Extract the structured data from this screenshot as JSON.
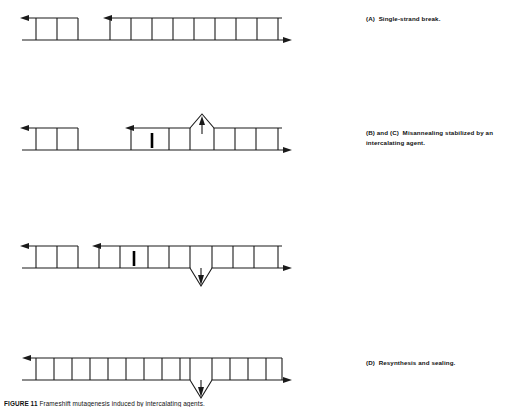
{
  "figure": {
    "title_number": "FIGURE 11",
    "title_text": "Frameshift mutagenesis induced by intercalating agents.",
    "caption_full": "FIGURE 11   Frameshift mutagenesis induced by intercalating agents."
  },
  "colors": {
    "ink": "#1a1a1a",
    "agent": "#000000",
    "background": "#ffffff"
  },
  "panels": [
    {
      "id": "panel-a",
      "label": "(A)",
      "caption": "Single-strand break.",
      "caption_lines": [
        "(A)  Single-strand break."
      ],
      "top": 0,
      "caption_top": 14,
      "diagram": {
        "type": "dna-duplex-ladder",
        "bottom_strand": {
          "x1": 22,
          "x2": 290,
          "y": 40,
          "arrow_right": true,
          "arrow_left": false
        },
        "top_segments": [
          {
            "x1": 22,
            "x2": 78,
            "y": 18,
            "arrow_left": true,
            "rungs": 3
          },
          {
            "x1": 103,
            "x2": 282,
            "y": 18,
            "arrow_left": true,
            "rungs": 9
          }
        ],
        "gap": {
          "x1": 78,
          "x2": 103,
          "y": 18
        },
        "intercalating_agent": null,
        "bulge": null
      }
    },
    {
      "id": "panel-b",
      "label": "(B)",
      "caption": "and (C)  Misannealing stabilized by an intercalating agent.",
      "caption_lines": [
        "(B) and (C)  Misannealing stabilized by an",
        "intercalating agent."
      ],
      "top": 110,
      "caption_top": 128,
      "diagram": {
        "type": "dna-duplex-ladder-bulge-up",
        "bottom_strand": {
          "x1": 22,
          "x2": 290,
          "y": 40,
          "arrow_right": true,
          "arrow_left": false
        },
        "top_segments": [
          {
            "x1": 22,
            "x2": 78,
            "y": 18,
            "arrow_left": true,
            "rungs": 3
          },
          {
            "x1": 125,
            "x2": 282,
            "y": 18,
            "arrow_left": true,
            "rungs": 9
          }
        ],
        "gap": {
          "x1": 78,
          "x2": 125,
          "y": 18
        },
        "intercalating_agent": {
          "x": 152,
          "y1": 22,
          "y2": 38
        },
        "bulge": {
          "direction": "up",
          "x_left": 190,
          "x_right": 214,
          "apex_x": 202,
          "apex_y": 4,
          "arrow_direction": "up",
          "arrow_x": 202,
          "arrow_tip_y": 8,
          "arrow_tail_y": 24
        }
      }
    },
    {
      "id": "panel-c",
      "label": "(C)",
      "caption": "",
      "caption_lines": [],
      "top": 228,
      "caption_top": 0,
      "diagram": {
        "type": "dna-duplex-ladder-bulge-down",
        "bottom_strand": {
          "x1": 22,
          "x2": 290,
          "y": 40,
          "arrow_right": true,
          "arrow_left": false
        },
        "top_segments": [
          {
            "x1": 22,
            "x2": 78,
            "y": 18,
            "arrow_left": true,
            "rungs": 3
          },
          {
            "x1": 92,
            "x2": 282,
            "y": 18,
            "arrow_left": true,
            "rungs": 11
          }
        ],
        "gap": {
          "x1": 78,
          "x2": 92,
          "y": 18
        },
        "intercalating_agent": {
          "x": 134,
          "y1": 22,
          "y2": 38
        },
        "bulge": {
          "direction": "down",
          "x_left": 190,
          "x_right": 212,
          "apex_x": 201,
          "apex_y": 58,
          "arrow_direction": "down",
          "arrow_x": 201,
          "arrow_tip_y": 54,
          "arrow_tail_y": 40
        }
      }
    },
    {
      "id": "panel-d",
      "label": "(D)",
      "caption": "Resynthesis and sealing.",
      "caption_lines": [
        "(D)  Resynthesis and sealing."
      ],
      "top": 340,
      "caption_top": 358,
      "diagram": {
        "type": "dna-duplex-ladder-sealed",
        "bottom_strand": {
          "x1": 22,
          "x2": 290,
          "y": 40,
          "arrow_right": true,
          "arrow_left": false
        },
        "top_segments": [
          {
            "x1": 22,
            "x2": 282,
            "y": 18,
            "arrow_left": true,
            "rungs": 15
          }
        ],
        "gap": null,
        "intercalating_agent": null,
        "bulge": {
          "direction": "down",
          "x_left": 190,
          "x_right": 212,
          "apex_x": 201,
          "apex_y": 58,
          "arrow_direction": "down",
          "arrow_x": 201,
          "arrow_tip_y": 54,
          "arrow_tail_y": 40
        }
      }
    }
  ]
}
